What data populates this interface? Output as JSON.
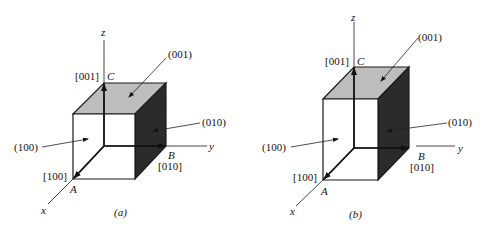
{
  "figure": {
    "colors": {
      "top_face": "#bdbdbd",
      "side_face": "#2b2b2b",
      "front_face": "#ffffff",
      "lines": "#1a1a1a"
    },
    "panels": [
      {
        "caption": "(a)",
        "shape": "cube",
        "axes": {
          "x": "x",
          "y": "y",
          "z": "z"
        },
        "points": {
          "A": "A",
          "B": "B",
          "C": "C"
        },
        "directions": {
          "x_dir": "[100]",
          "y_dir": "[010]",
          "z_dir": "[001]"
        },
        "planes": {
          "top": "(001)",
          "side": "(010)",
          "front": "(100)"
        }
      },
      {
        "caption": "(b)",
        "shape": "tall prism",
        "axes": {
          "x": "x",
          "y": "y",
          "z": "z"
        },
        "points": {
          "A": "A",
          "B": "B",
          "C": "C"
        },
        "directions": {
          "x_dir": "[100]",
          "y_dir": "[010]",
          "z_dir": "[001]"
        },
        "planes": {
          "top": "(001)",
          "side": "(010)",
          "front": "(100)"
        }
      }
    ]
  }
}
